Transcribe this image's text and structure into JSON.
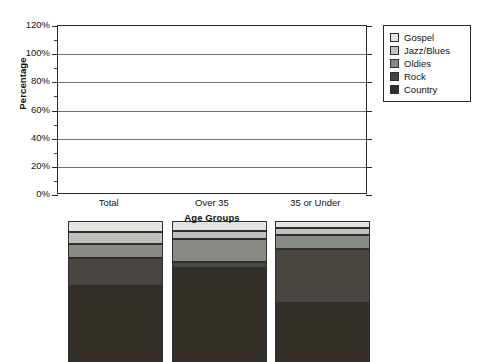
{
  "chart_data": {
    "type": "bar",
    "stacked": true,
    "title": "",
    "xlabel": "Age Groups",
    "ylabel": "Percentage",
    "categories": [
      "Total",
      "Over 35",
      "35 or Under"
    ],
    "ylim": [
      0,
      120
    ],
    "y_tick_labels": [
      "0%",
      "20%",
      "40%",
      "60%",
      "80%",
      "100%",
      "120%"
    ],
    "y_tick_values": [
      0,
      20,
      40,
      60,
      80,
      100,
      120
    ],
    "y_minor_tick_values": [
      10,
      30,
      50,
      70,
      90,
      110
    ],
    "y_tick_suffix": "%",
    "grid": true,
    "legend_position": "right",
    "series": [
      {
        "name": "Gospel",
        "color": "#e3e3e1",
        "values": [
          8,
          7,
          5
        ]
      },
      {
        "name": "Jazz/Blues",
        "color": "#c0c0bd",
        "values": [
          8,
          6,
          5
        ]
      },
      {
        "name": "Oldies",
        "color": "#8a8a85",
        "values": [
          10,
          16,
          10
        ]
      },
      {
        "name": "Rock",
        "color": "#4a463f",
        "values": [
          20,
          4,
          38
        ]
      },
      {
        "name": "Country",
        "color": "#332f28",
        "values": [
          54,
          67,
          42
        ]
      }
    ],
    "legend_order": [
      "Gospel",
      "Jazz/Blues",
      "Oldies",
      "Rock",
      "Country"
    ]
  }
}
